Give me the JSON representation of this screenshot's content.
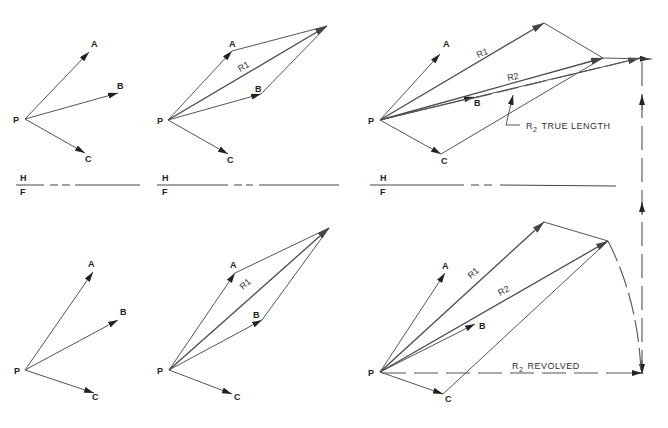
{
  "diagram": {
    "type": "vector-resultant-construction",
    "point_labels": {
      "P": "P",
      "A": "A",
      "B": "B",
      "C": "C"
    },
    "resultant_labels": {
      "r1": "R1",
      "r2": "R2"
    },
    "plane_labels": {
      "h": "H",
      "f": "F"
    },
    "annotations": {
      "true_length": "R2 TRUE LENGTH",
      "revolved": "R2 REVOLVED",
      "true_length_prefix": "R",
      "true_length_sub": "2",
      "true_length_suffix": "TRUE LENGTH",
      "revolved_prefix": "R",
      "revolved_sub": "2",
      "revolved_suffix": "REVOLVED"
    },
    "panels": [
      {
        "id": "top-1",
        "view": "H",
        "content": "Vectors PA, PB, PC"
      },
      {
        "id": "top-2",
        "view": "H",
        "content": "Parallelogram PA + PB = R1"
      },
      {
        "id": "top-3",
        "view": "H",
        "content": "R1 + PC = R2, R2 true length"
      },
      {
        "id": "bottom-1",
        "view": "F",
        "content": "Vectors PA, PB, PC"
      },
      {
        "id": "bottom-2",
        "view": "F",
        "content": "Parallelogram PA + PB = R1"
      },
      {
        "id": "bottom-3",
        "view": "F",
        "content": "R1 + PC = R2, R2 revolved"
      }
    ]
  }
}
